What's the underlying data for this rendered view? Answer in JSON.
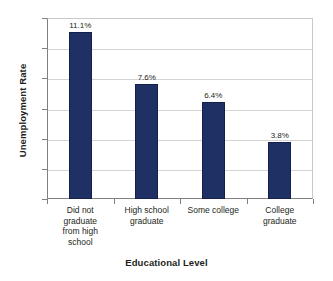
{
  "chart_data": {
    "type": "bar",
    "title": "",
    "xlabel": "Educational Level",
    "ylabel": "Unemployment Rate",
    "categories": [
      "Did not graduate from high school",
      "High school graduate",
      "Some college",
      "College graduate"
    ],
    "category_lines": [
      [
        "Did not",
        "graduate",
        "from high",
        "school"
      ],
      [
        "High school",
        "graduate"
      ],
      [
        "Some college"
      ],
      [
        "College",
        "graduate"
      ]
    ],
    "values": [
      11.1,
      7.6,
      6.4,
      3.8
    ],
    "data_labels": [
      "11.1%",
      "7.6%",
      "6.4%",
      "3.8%"
    ],
    "ylim": [
      0,
      12
    ],
    "ytick_values": [
      0,
      2,
      4,
      6,
      8,
      10,
      12
    ],
    "ytick_labels": [
      "0",
      "2",
      "4",
      "6",
      "8",
      "10",
      "12"
    ],
    "grid": true,
    "legend": false,
    "legend_position": "none",
    "colors": {
      "bar": "#1F3064",
      "bar_border": "#14204A",
      "gridline": "#D4D4D4",
      "axis": "#808080",
      "text": "#231F20",
      "background": "#FFFFFF"
    }
  }
}
